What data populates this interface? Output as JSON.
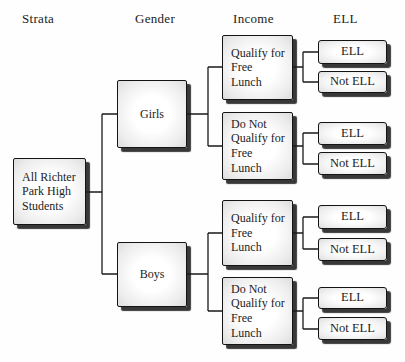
{
  "diagram_title": "Stratified sampling tree diagram",
  "colors": {
    "line": "#1a1a1a",
    "box_border": "#141414",
    "box_fill_center": "#ffffff",
    "box_fill_edge": "#dcdcdc",
    "box_shadow": "#1c1c1c",
    "text": "#1c1c1c",
    "background": "#fefefe"
  },
  "headers": {
    "strata": "Strata",
    "gender": "Gender",
    "income": "Income",
    "ell": "ELL"
  },
  "nodes": {
    "root": {
      "label": "All Richter\nPark High\nStudents"
    },
    "girls": {
      "label": "Girls"
    },
    "boys": {
      "label": "Boys"
    },
    "girls_qualify": {
      "label": "Qualify for\nFree\nLunch"
    },
    "girls_not_qualify": {
      "label": "Do Not\nQualify for\nFree\nLunch"
    },
    "boys_qualify": {
      "label": "Qualify for\nFree\nLunch"
    },
    "boys_not_qualify": {
      "label": "Do Not\nQualify for\nFree\nLunch"
    },
    "girls_qualify_ell": {
      "label": "ELL"
    },
    "girls_qualify_not_ell": {
      "label": "Not ELL"
    },
    "girls_not_qualify_ell": {
      "label": "ELL"
    },
    "girls_not_qualify_not_ell": {
      "label": "Not ELL"
    },
    "boys_qualify_ell": {
      "label": "ELL"
    },
    "boys_qualify_not_ell": {
      "label": "Not ELL"
    },
    "boys_not_qualify_ell": {
      "label": "ELL"
    },
    "boys_not_qualify_not_ell": {
      "label": "Not ELL"
    }
  }
}
